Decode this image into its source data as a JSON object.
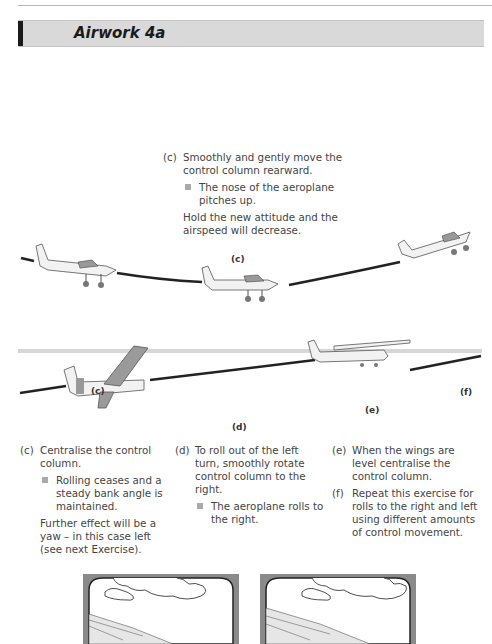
{
  "page": {
    "title": "Airwork 4a"
  },
  "upper_diagram": {
    "step": {
      "label": "(c)",
      "text": "Smoothly and gently move the control column rearward.",
      "bullet": "The nose of the aeroplane pitches up.",
      "note": "Hold the new attitude and the airspeed will decrease."
    },
    "figure_label": "(c)"
  },
  "lower_diagram": {
    "figure_labels": [
      "(c)",
      "(d)",
      "(e)",
      "(f)"
    ],
    "columns": [
      {
        "label": "(c)",
        "text": "Centralise the control column.",
        "bullet": "Rolling ceases and a steady bank angle is maintained.",
        "note": "Further effect will be a yaw – in this case left (see next Exercise)."
      },
      {
        "label": "(d)",
        "text": "To roll out of the left turn, smoothly rotate control column to the right.",
        "bullet": "The aeroplane rolls to the right."
      },
      {
        "items": [
          {
            "label": "(e)",
            "text": "When the wings are level centralise the control column."
          },
          {
            "label": "(f)",
            "text": "Repeat this exercise for rolls to the right and left using different amounts of control movement."
          }
        ]
      }
    ]
  },
  "cockpit_views": {
    "count": 2,
    "frame_color": "#8a8a8a"
  }
}
